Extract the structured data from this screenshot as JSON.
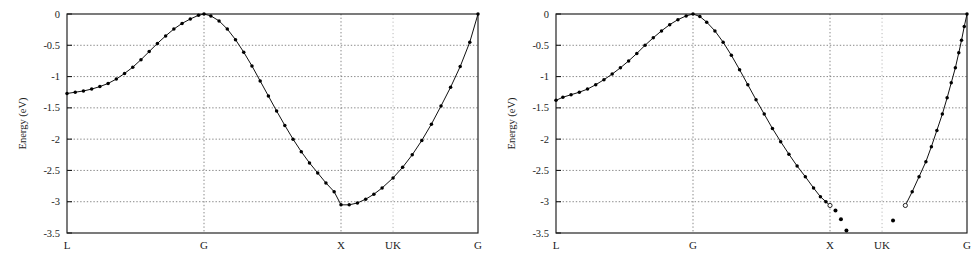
{
  "figure": {
    "title": "",
    "panel_count": 2
  },
  "chart_data": [
    {
      "id": "left-panel",
      "type": "line",
      "title": "",
      "xlabel": "",
      "ylabel": "Energy (eV)",
      "ylim": [
        -3.5,
        0
      ],
      "xlim": [
        0,
        3
      ],
      "yticks": [
        0,
        -0.5,
        -1,
        -1.5,
        -2,
        -2.5,
        -3,
        -3.5
      ],
      "ytick_labels": [
        "0",
        "-0.5",
        "-1",
        "-1.5",
        "-2",
        "-2.5",
        "-3",
        "-3.5"
      ],
      "xtick_positions": [
        0,
        1,
        2,
        2.38,
        3
      ],
      "xtick_labels": [
        "L",
        "G",
        "X",
        "UK",
        "G"
      ],
      "grid": true,
      "grid_vertical_at": [
        "G",
        "X",
        "UK"
      ],
      "legend": "none",
      "marker": "filled-circle",
      "series": [
        {
          "name": "band",
          "x": [
            0.0,
            0.06,
            0.12,
            0.18,
            0.24,
            0.3,
            0.36,
            0.42,
            0.48,
            0.54,
            0.6,
            0.66,
            0.72,
            0.78,
            0.84,
            0.9,
            0.96,
            1.0,
            1.05,
            1.11,
            1.17,
            1.23,
            1.29,
            1.35,
            1.41,
            1.47,
            1.53,
            1.59,
            1.65,
            1.71,
            1.77,
            1.83,
            1.89,
            1.95,
            2.0,
            2.06,
            2.12,
            2.18,
            2.24,
            2.3,
            2.38,
            2.45,
            2.52,
            2.59,
            2.66,
            2.73,
            2.8,
            2.87,
            2.94,
            3.0
          ],
          "y": [
            -1.27,
            -1.25,
            -1.23,
            -1.2,
            -1.16,
            -1.11,
            -1.04,
            -0.95,
            -0.85,
            -0.73,
            -0.6,
            -0.47,
            -0.35,
            -0.24,
            -0.15,
            -0.08,
            -0.02,
            0.0,
            -0.03,
            -0.11,
            -0.24,
            -0.41,
            -0.61,
            -0.83,
            -1.07,
            -1.31,
            -1.55,
            -1.78,
            -2.0,
            -2.2,
            -2.38,
            -2.54,
            -2.7,
            -2.84,
            -3.05,
            -3.05,
            -3.02,
            -2.96,
            -2.88,
            -2.78,
            -2.62,
            -2.45,
            -2.25,
            -2.02,
            -1.76,
            -1.47,
            -1.17,
            -0.84,
            -0.45,
            0.0
          ]
        }
      ]
    },
    {
      "id": "right-panel",
      "type": "line",
      "title": "",
      "xlabel": "",
      "ylabel": "Energy (eV)",
      "ylim": [
        -3.5,
        0
      ],
      "xlim": [
        0,
        3
      ],
      "yticks": [
        0,
        -0.5,
        -1,
        -1.5,
        -2,
        -2.5,
        -3,
        -3.5
      ],
      "ytick_labels": [
        "0",
        "-0.5",
        "-1",
        "-1.5",
        "-2",
        "-2.5",
        "-3",
        "-3.5"
      ],
      "xtick_positions": [
        0,
        1,
        2,
        2.38,
        3
      ],
      "xtick_labels": [
        "L",
        "G",
        "X",
        "UK",
        "G"
      ],
      "grid": true,
      "grid_vertical_at": [
        "G",
        "X",
        "UK"
      ],
      "legend": "none",
      "marker": "filled-circle",
      "series": [
        {
          "name": "band-segment-L-to-X",
          "x": [
            0.0,
            0.05,
            0.11,
            0.17,
            0.23,
            0.29,
            0.35,
            0.41,
            0.47,
            0.53,
            0.59,
            0.65,
            0.71,
            0.77,
            0.83,
            0.89,
            0.95,
            1.0,
            1.05,
            1.1,
            1.16,
            1.22,
            1.28,
            1.34,
            1.4,
            1.46,
            1.52,
            1.58,
            1.64,
            1.7,
            1.76,
            1.82,
            1.88,
            1.93,
            1.97,
            2.0
          ],
          "y": [
            -1.38,
            -1.33,
            -1.29,
            -1.25,
            -1.2,
            -1.13,
            -1.05,
            -0.96,
            -0.86,
            -0.75,
            -0.63,
            -0.5,
            -0.38,
            -0.27,
            -0.17,
            -0.09,
            -0.03,
            0.0,
            -0.04,
            -0.13,
            -0.27,
            -0.45,
            -0.66,
            -0.89,
            -1.13,
            -1.37,
            -1.6,
            -1.83,
            -2.04,
            -2.24,
            -2.43,
            -2.6,
            -2.78,
            -2.92,
            -3.0,
            -3.06
          ]
        },
        {
          "name": "band-segment-G-ascend",
          "x": [
            2.55,
            2.6,
            2.65,
            2.7,
            2.74,
            2.78,
            2.82,
            2.855,
            2.885,
            2.915,
            2.94,
            2.96,
            2.98,
            3.0
          ],
          "y": [
            -3.06,
            -2.84,
            -2.6,
            -2.36,
            -2.12,
            -1.86,
            -1.6,
            -1.34,
            -1.1,
            -0.86,
            -0.62,
            -0.42,
            -0.2,
            0.0
          ]
        }
      ],
      "scatter_points": [
        {
          "x": 2.04,
          "y": -3.14
        },
        {
          "x": 2.08,
          "y": -3.28
        },
        {
          "x": 2.12,
          "y": -3.46
        },
        {
          "x": 2.46,
          "y": -3.3
        }
      ],
      "open_points": [
        {
          "x": 2.0,
          "y": -3.06
        },
        {
          "x": 2.55,
          "y": -3.06
        }
      ]
    }
  ]
}
